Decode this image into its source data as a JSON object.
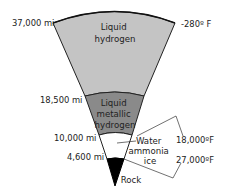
{
  "layers": [
    {
      "name": "liquid-hydrogen",
      "label_lines": [
        "Liquid",
        "hydrogen"
      ],
      "color": "#c4c4c4"
    },
    {
      "name": "liquid-metallic-hydrogen",
      "label_lines": [
        "Liquid",
        "metallic",
        "hydrogen"
      ],
      "color": "#8a8a8a"
    },
    {
      "name": "water-ammonia-ice",
      "label_lines": [
        "Water",
        "ammonia",
        "ice"
      ],
      "color": "#ffffff"
    },
    {
      "name": "rock",
      "label_lines": [
        "Rock"
      ],
      "color": "#000000"
    }
  ],
  "radii": [
    "37,000 mi",
    "18,500 mi",
    "10,000 mi",
    "4,600 mi"
  ],
  "temperatures": [
    "-280º F",
    "18,000ºF",
    "27,000ºF"
  ]
}
